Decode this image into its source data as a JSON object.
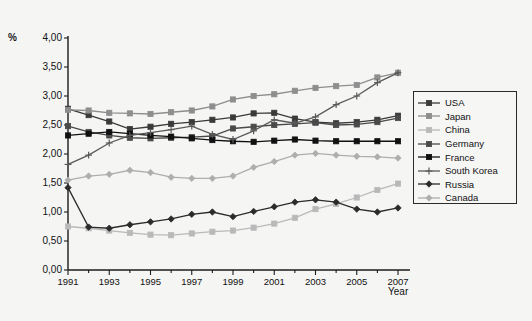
{
  "axis": {
    "unit_symbol": "%",
    "x_title": "Year",
    "y_ticks": [
      "4,00",
      "3,50",
      "3,00",
      "2,50",
      "2,00",
      "1,50",
      "1,00",
      "0,50",
      "0,00"
    ],
    "x_ticks": [
      "1991",
      "1993",
      "1995",
      "1997",
      "1999",
      "2001",
      "2003",
      "2005",
      "2007"
    ]
  },
  "legend": {
    "items": [
      {
        "label": "USA",
        "color": "#3a3a3a",
        "marker": "square"
      },
      {
        "label": "Japan",
        "color": "#8e8e8e",
        "marker": "square"
      },
      {
        "label": "China",
        "color": "#b9b9b9",
        "marker": "square"
      },
      {
        "label": "Germany",
        "color": "#4a4a4a",
        "marker": "square"
      },
      {
        "label": "France",
        "color": "#111111",
        "marker": "square"
      },
      {
        "label": "South Korea",
        "color": "#5a5a5a",
        "marker": "plus"
      },
      {
        "label": "Russia",
        "color": "#2b2b2b",
        "marker": "diamond"
      },
      {
        "label": "Canada",
        "color": "#aeaeae",
        "marker": "diamond"
      }
    ]
  },
  "chart_data": {
    "type": "line",
    "title": "",
    "xlabel": "Year",
    "ylabel": "%",
    "xlim": [
      1991,
      2007
    ],
    "ylim": [
      0,
      4
    ],
    "ytick_step": 0.5,
    "grid": false,
    "legend_position": "right",
    "x": [
      1991,
      1992,
      1993,
      1994,
      1995,
      1996,
      1997,
      1998,
      1999,
      2000,
      2001,
      2002,
      2003,
      2004,
      2005,
      2006,
      2007
    ],
    "series": [
      {
        "name": "USA",
        "color": "#3a3a3a",
        "marker": "square",
        "values": [
          2.78,
          2.67,
          2.56,
          2.43,
          2.47,
          2.52,
          2.55,
          2.59,
          2.63,
          2.7,
          2.71,
          2.61,
          2.55,
          2.53,
          2.55,
          2.59,
          2.66
        ]
      },
      {
        "name": "Japan",
        "color": "#8e8e8e",
        "marker": "square",
        "values": [
          2.76,
          2.75,
          2.71,
          2.7,
          2.69,
          2.72,
          2.75,
          2.82,
          2.94,
          3.0,
          3.03,
          3.09,
          3.14,
          3.17,
          3.19,
          3.32,
          3.4
        ]
      },
      {
        "name": "China",
        "color": "#b9b9b9",
        "marker": "square",
        "values": [
          0.75,
          0.72,
          0.68,
          0.64,
          0.61,
          0.6,
          0.63,
          0.66,
          0.68,
          0.73,
          0.8,
          0.9,
          1.05,
          1.14,
          1.25,
          1.38,
          1.49
        ]
      },
      {
        "name": "Germany",
        "color": "#4a4a4a",
        "marker": "square",
        "values": [
          2.48,
          2.38,
          2.32,
          2.28,
          2.27,
          2.28,
          2.29,
          2.31,
          2.44,
          2.47,
          2.5,
          2.52,
          2.54,
          2.5,
          2.51,
          2.55,
          2.62
        ]
      },
      {
        "name": "France",
        "color": "#111111",
        "marker": "square",
        "values": [
          2.32,
          2.35,
          2.38,
          2.35,
          2.32,
          2.3,
          2.27,
          2.24,
          2.22,
          2.21,
          2.23,
          2.25,
          2.23,
          2.22,
          2.22,
          2.22,
          2.22
        ]
      },
      {
        "name": "South Korea",
        "color": "#5a5a5a",
        "marker": "plus",
        "values": [
          1.82,
          1.98,
          2.19,
          2.32,
          2.37,
          2.42,
          2.48,
          2.34,
          2.25,
          2.4,
          2.59,
          2.53,
          2.64,
          2.85,
          3.0,
          3.23,
          3.4
        ]
      },
      {
        "name": "Russia",
        "color": "#2b2b2b",
        "marker": "diamond",
        "values": [
          1.42,
          0.74,
          0.72,
          0.78,
          0.83,
          0.88,
          0.96,
          1.0,
          0.92,
          1.01,
          1.09,
          1.17,
          1.21,
          1.17,
          1.05,
          1.0,
          1.07
        ]
      },
      {
        "name": "Canada",
        "color": "#aeaeae",
        "marker": "diamond",
        "values": [
          1.55,
          1.62,
          1.65,
          1.72,
          1.68,
          1.6,
          1.58,
          1.58,
          1.62,
          1.77,
          1.87,
          1.98,
          2.01,
          1.98,
          1.96,
          1.95,
          1.93
        ]
      }
    ]
  }
}
